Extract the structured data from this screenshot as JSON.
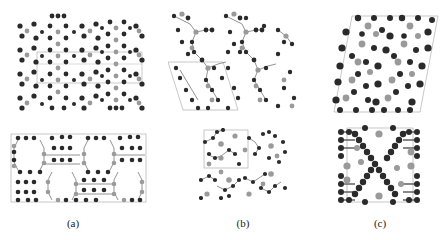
{
  "figure": {
    "panels": [
      {
        "id": "a",
        "label": "(a)",
        "description": "Crystal structure, two projections: layered columns (top) and rectangular unit cell with hexagonal rings (bottom)"
      },
      {
        "id": "b",
        "label": "(b)",
        "description": "Crystal structure, two projections: oblique unit cell with zigzag chains (top) and smaller cell (bottom)"
      },
      {
        "id": "c",
        "label": "(c)",
        "description": "Crystal structure, two projections: dense packing with large atoms (top) and X-shaped chains (bottom)"
      }
    ]
  },
  "colors": {
    "dark_atom": "#2a2a2a",
    "light_atom": "#9a9a9a",
    "cell_line": "#b0b0b0",
    "bond": "#777777"
  }
}
